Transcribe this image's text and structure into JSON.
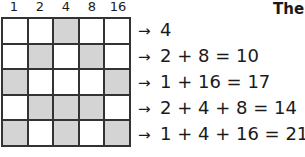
{
  "title": "The",
  "columns": [
    "1",
    "2",
    "4",
    "8",
    "16"
  ],
  "shade_color": "#d4d4d4",
  "grid": [
    [
      0,
      0,
      1,
      0,
      0
    ],
    [
      0,
      1,
      0,
      1,
      0
    ],
    [
      1,
      0,
      0,
      0,
      1
    ],
    [
      0,
      1,
      1,
      1,
      0
    ],
    [
      1,
      0,
      1,
      0,
      1
    ]
  ],
  "rows": [
    {
      "arrow": "→",
      "expr": "4"
    },
    {
      "arrow": "→",
      "expr": "2 + 8 = 10"
    },
    {
      "arrow": "→",
      "expr": "1 + 16 = 17"
    },
    {
      "arrow": "→",
      "expr": "2 + 4 + 8 = 14"
    },
    {
      "arrow": "→",
      "expr": "1 + 4 + 16 = 21"
    }
  ]
}
